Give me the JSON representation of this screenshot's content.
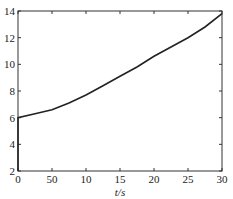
{
  "chart_data": {
    "type": "line",
    "title": "",
    "xlabel": "t/s",
    "ylabel": "",
    "xlim": [
      0,
      30
    ],
    "ylim": [
      2,
      14
    ],
    "grid": false,
    "legend": null,
    "x_ticks": [
      0,
      5,
      10,
      15,
      20,
      25,
      30
    ],
    "x_tick_labels": [
      "0",
      "50",
      "10",
      "15",
      "20",
      "25",
      "30"
    ],
    "y_ticks": [
      2,
      4,
      6,
      8,
      10,
      12,
      14
    ],
    "y_tick_labels": [
      "2",
      "4",
      "6",
      "8",
      "10",
      "12",
      "14"
    ],
    "series": [
      {
        "name": "curve",
        "color": "#222222",
        "x": [
          0,
          0,
          2.5,
          5,
          7.5,
          10,
          12.5,
          15,
          17.5,
          20,
          22.5,
          25,
          27.5,
          30
        ],
        "y": [
          2.0,
          6.0,
          6.3,
          6.6,
          7.1,
          7.7,
          8.4,
          9.1,
          9.8,
          10.6,
          11.3,
          12.0,
          12.8,
          13.8
        ]
      }
    ]
  },
  "plot_box": {
    "left": 18,
    "right": 222,
    "top": 11,
    "bottom": 171
  }
}
